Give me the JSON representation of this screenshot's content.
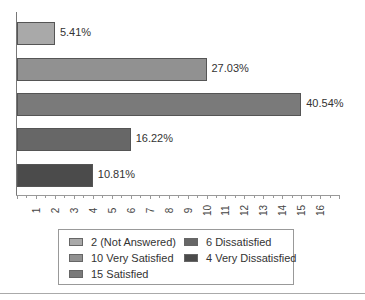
{
  "chart_data": {
    "type": "bar",
    "orientation": "horizontal",
    "title": "",
    "xlabel": "",
    "ylabel": "",
    "xlim": [
      0,
      17
    ],
    "x_ticks": [
      "1",
      "2",
      "3",
      "4",
      "5",
      "6",
      "7",
      "8",
      "9",
      "10",
      "11",
      "12",
      "13",
      "14",
      "15",
      "16"
    ],
    "categories": [
      "Not Answered",
      "Very Satisfied",
      "Satisfied",
      "Dissatisfied",
      "Very Dissatisfied"
    ],
    "values": [
      2,
      10,
      15,
      6,
      4
    ],
    "percent_labels": [
      "5.41%",
      "27.03%",
      "40.54%",
      "16.22%",
      "10.81%"
    ],
    "colors": [
      "#a9a9a9",
      "#919191",
      "#7a7a7a",
      "#676767",
      "#4b4b4b"
    ],
    "legend": [
      {
        "label": "2 (Not Answered)",
        "color": "#a9a9a9"
      },
      {
        "label": "10 Very Satisfied",
        "color": "#919191"
      },
      {
        "label": "15 Satisfied",
        "color": "#7a7a7a"
      },
      {
        "label": "6 Dissatisfied",
        "color": "#676767"
      },
      {
        "label": "4 Very Dissatisfied",
        "color": "#4b4b4b"
      }
    ],
    "legend_position": "bottom",
    "grid": false
  }
}
